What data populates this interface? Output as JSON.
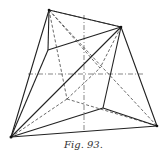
{
  "caption": "Fig. 93.",
  "colors": {
    "ink": "#222222",
    "background": "#ffffff"
  },
  "vertices": {
    "A_top": [
      49,
      10
    ],
    "B_right": [
      121,
      27
    ],
    "C_bottom_left": [
      11,
      137
    ],
    "D_bottom_right": [
      157,
      126
    ],
    "E_inner_left": [
      48,
      50
    ],
    "F_inner_bottom": [
      103,
      108
    ],
    "G_hidden": [
      67,
      99
    ]
  },
  "axes": {
    "horizontal": {
      "from": [
        28,
        74
      ],
      "to": [
        145,
        74
      ]
    },
    "vertical": {
      "from": [
        84,
        15
      ],
      "to": [
        84,
        132
      ]
    }
  }
}
